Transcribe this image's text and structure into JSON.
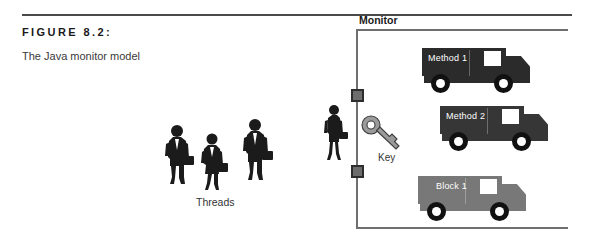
{
  "figure": {
    "label": "FIGURE 8.2:",
    "caption": "The Java monitor model"
  },
  "monitor": {
    "title": "Monitor",
    "bracket_color": "#6f6f6f",
    "connectors": [
      {
        "name": "connector-upper"
      },
      {
        "name": "connector-lower"
      }
    ],
    "resources": [
      {
        "label": "Method 1",
        "color": "#2b2b2b",
        "icon": "truck-icon"
      },
      {
        "label": "Method 2",
        "color": "#363636",
        "icon": "truck-icon"
      },
      {
        "label": "Block 1",
        "color": "#787878",
        "icon": "truck-icon"
      }
    ]
  },
  "key": {
    "label": "Key",
    "icon": "key-icon",
    "color": "#9a9a9a"
  },
  "threads": {
    "label": "Threads",
    "people": [
      {
        "icon": "businessman-silhouette-icon"
      },
      {
        "icon": "businesswoman-silhouette-icon"
      },
      {
        "icon": "businessman-silhouette-icon"
      }
    ]
  },
  "monitor_holder": {
    "icon": "businesswoman-silhouette-icon"
  }
}
